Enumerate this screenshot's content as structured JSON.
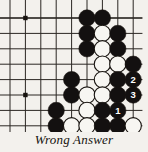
{
  "figure": {
    "type": "go-board-diagram",
    "caption": "Wrong Answer",
    "board": {
      "cols": 9,
      "rows": 8,
      "origin_x": 10,
      "origin_y": 18,
      "spacing": 15.4,
      "line_color": "#2b2723",
      "edge_color": "#17130f",
      "background": "#f3f1ed",
      "star_points": [
        {
          "col": 1,
          "row": 0
        },
        {
          "col": 1,
          "row": 5
        }
      ]
    },
    "colors": {
      "black_stone": "#131010",
      "white_stone": "#f7f6f2",
      "stone_outline": "#17130f",
      "black_label": "#ffffff",
      "white_label": "#17130f",
      "paper": "#f3f1ed"
    },
    "stones": [
      {
        "col": 5,
        "row": 0,
        "color": "black",
        "label": ""
      },
      {
        "col": 6,
        "row": 0,
        "color": "black",
        "label": ""
      },
      {
        "col": 5,
        "row": 1,
        "color": "black",
        "label": ""
      },
      {
        "col": 6,
        "row": 1,
        "color": "white",
        "label": ""
      },
      {
        "col": 7,
        "row": 1,
        "color": "black",
        "label": ""
      },
      {
        "col": 5,
        "row": 2,
        "color": "black",
        "label": ""
      },
      {
        "col": 6,
        "row": 2,
        "color": "white",
        "label": ""
      },
      {
        "col": 7,
        "row": 2,
        "color": "black",
        "label": ""
      },
      {
        "col": 6,
        "row": 3,
        "color": "white",
        "label": ""
      },
      {
        "col": 7,
        "row": 3,
        "color": "white",
        "label": ""
      },
      {
        "col": 8,
        "row": 3,
        "color": "black",
        "label": ""
      },
      {
        "col": 4,
        "row": 4,
        "color": "black",
        "label": ""
      },
      {
        "col": 6,
        "row": 4,
        "color": "white",
        "label": ""
      },
      {
        "col": 7,
        "row": 4,
        "color": "black",
        "label": ""
      },
      {
        "col": 8,
        "row": 4,
        "color": "black",
        "label": "2"
      },
      {
        "col": 4,
        "row": 5,
        "color": "black",
        "label": ""
      },
      {
        "col": 5,
        "row": 5,
        "color": "white",
        "label": ""
      },
      {
        "col": 6,
        "row": 5,
        "color": "white",
        "label": ""
      },
      {
        "col": 7,
        "row": 5,
        "color": "black",
        "label": ""
      },
      {
        "col": 8,
        "row": 5,
        "color": "black",
        "label": "3"
      },
      {
        "col": 5,
        "row": 6,
        "color": "white",
        "label": ""
      },
      {
        "col": 6,
        "row": 6,
        "color": "black",
        "label": ""
      },
      {
        "col": 7,
        "row": 6,
        "color": "black",
        "label": "1"
      },
      {
        "col": 3,
        "row": 6,
        "color": "black",
        "label": ""
      },
      {
        "col": 3,
        "row": 7,
        "color": "black",
        "label": ""
      },
      {
        "col": 4,
        "row": 7,
        "color": "white",
        "label": ""
      },
      {
        "col": 5,
        "row": 7,
        "color": "white",
        "label": ""
      },
      {
        "col": 6,
        "row": 7,
        "color": "black",
        "label": ""
      },
      {
        "col": 7,
        "row": 7,
        "color": "black",
        "label": ""
      },
      {
        "col": 8,
        "row": 7,
        "color": "white",
        "label": ""
      },
      {
        "col": 5,
        "row": 8,
        "color": "white",
        "label": ""
      },
      {
        "col": 6,
        "row": 8,
        "color": "white",
        "label": ""
      },
      {
        "col": 7,
        "row": 8,
        "color": "black",
        "label": ""
      },
      {
        "col": 8,
        "row": 8,
        "color": "white",
        "label": "4"
      },
      {
        "col": 5,
        "row": 9,
        "color": "white",
        "label": ""
      },
      {
        "col": 6,
        "row": 9,
        "color": "white",
        "label": ""
      },
      {
        "col": 7,
        "row": 9,
        "color": "white",
        "label": ""
      },
      {
        "col": 8,
        "row": 9,
        "color": "white",
        "label": ""
      }
    ],
    "move_numbers": [
      {
        "number": "1",
        "color": "black"
      },
      {
        "number": "2",
        "color": "black"
      },
      {
        "number": "3",
        "color": "black"
      },
      {
        "number": "4",
        "color": "white"
      }
    ]
  }
}
